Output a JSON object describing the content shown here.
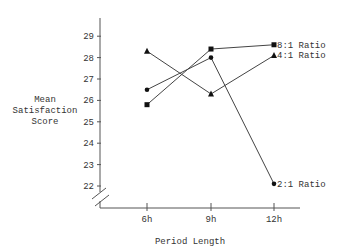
{
  "chart_data": {
    "type": "line",
    "title": "",
    "xlabel": "Period Length",
    "ylabel": "Mean Satisfaction Score",
    "ylabel_lines": [
      "Mean",
      "Satisfaction",
      "Score"
    ],
    "categories": [
      "6h",
      "9h",
      "12h"
    ],
    "yticks": [
      "22",
      "23",
      "24",
      "25",
      "26",
      "27",
      "28",
      "29"
    ],
    "ylim": [
      21.5,
      29.5
    ],
    "axis_break": true,
    "grid": false,
    "legend_position": "inline-right",
    "series": [
      {
        "name": "8:1 Ratio",
        "marker": "square",
        "values": [
          25.8,
          28.4,
          28.6
        ]
      },
      {
        "name": "4:1 Ratio",
        "marker": "triangle",
        "values": [
          28.3,
          26.3,
          28.1
        ]
      },
      {
        "name": "2:1 Ratio",
        "marker": "circle",
        "values": [
          26.5,
          28.0,
          22.1
        ]
      }
    ]
  }
}
